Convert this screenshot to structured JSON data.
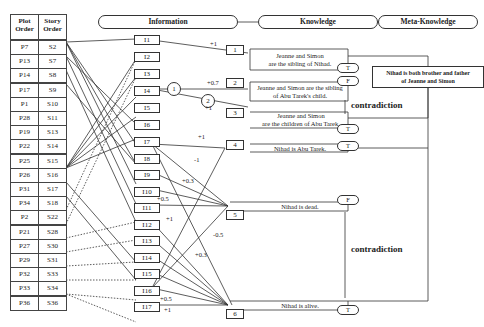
{
  "table": {
    "headers": [
      "Plot\nOrder",
      "Story\nOrder"
    ],
    "header_plot": "Plot Order",
    "header_story": "Story Order",
    "rows": [
      {
        "plot": "P7",
        "story": "S2"
      },
      {
        "plot": "P13",
        "story": "S7"
      },
      {
        "plot": "P14",
        "story": "S8"
      },
      {
        "plot": "P17",
        "story": "S9"
      },
      {
        "plot": "P1",
        "story": "S10"
      },
      {
        "plot": "P28",
        "story": "S11"
      },
      {
        "plot": "P19",
        "story": "S13"
      },
      {
        "plot": "P22",
        "story": "S14"
      },
      {
        "plot": "P25",
        "story": "S15"
      },
      {
        "plot": "P26",
        "story": "S16"
      },
      {
        "plot": "P31",
        "story": "S17"
      },
      {
        "plot": "P34",
        "story": "S18"
      },
      {
        "plot": "P2",
        "story": "S22"
      },
      {
        "plot": "P21",
        "story": "S28"
      },
      {
        "plot": "P27",
        "story": "S30"
      },
      {
        "plot": "P29",
        "story": "S31"
      },
      {
        "plot": "P32",
        "story": "S33"
      },
      {
        "plot": "P33",
        "story": "S34"
      },
      {
        "plot": "P36",
        "story": "S36"
      }
    ]
  },
  "columns": {
    "information": "Information",
    "knowledge": "Knowledge",
    "meta_knowledge": "Meta-Knowledge"
  },
  "information_items": [
    "I1",
    "I2",
    "I3",
    "I4",
    "I5",
    "I6",
    "I7",
    "I8",
    "I9",
    "I10",
    "I11",
    "I12",
    "I13",
    "I14",
    "I15",
    "I16",
    "I17"
  ],
  "knowledge_items": [
    {
      "id": "1",
      "text_line1": "Jeanne and Simon",
      "text_line2": "are the sibling of Nihad.",
      "truth": "T"
    },
    {
      "id": "2",
      "text_line1": "Jeanne and Simon are the sibling",
      "text_line2": "of Abu Tarek's child.",
      "truth": "F"
    },
    {
      "id": "3",
      "text_line1": "Jeanne and Simon",
      "text_line2": "are the children of Abu Tarek.",
      "truth": "T"
    },
    {
      "id": "4",
      "text_line1": "Nihad is Abu Tarek.",
      "text_line2": "",
      "truth": "T"
    },
    {
      "id": "5",
      "text_line1": "Nihad is dead.",
      "text_line2": "",
      "truth": "F"
    },
    {
      "id": "6",
      "text_line1": "Nihad is alive.",
      "text_line2": "",
      "truth": "T"
    }
  ],
  "meta_knowledge": {
    "line1": "Nihad is both brother and father",
    "line2": "of Jeanne and Simon"
  },
  "weights": {
    "i1_k1": "+1",
    "i4_k2": "+0.7",
    "i4_k3": "+1",
    "i7_k4": "+1",
    "i7_k5": "-1",
    "i9_k5": "+0.3",
    "i11_k5": "+0.5",
    "i16_k4": "+1",
    "i16_k5": "-0.5",
    "i14_k6": "+0.3",
    "i16_k6": "+0.5",
    "i17_k6": "+1"
  },
  "branch_circles": [
    "1",
    "2"
  ],
  "contradictions": [
    "contradiction",
    "contradiction"
  ]
}
